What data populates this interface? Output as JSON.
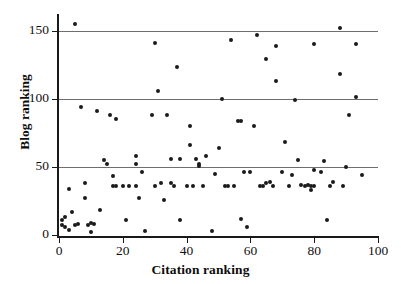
{
  "chart_data": {
    "type": "scatter",
    "title": "",
    "xlabel": "Citation ranking",
    "ylabel": "Blog ranking",
    "xlim": [
      0,
      100
    ],
    "ylim": [
      0,
      160
    ],
    "xticks": [
      0,
      20,
      40,
      60,
      80,
      100
    ],
    "yticks": [
      0,
      50,
      100,
      150
    ],
    "xtick_labels": [
      "0",
      "20",
      "40",
      "60",
      "80",
      "100"
    ],
    "ytick_labels": [
      "0",
      "50",
      "100",
      "150"
    ],
    "gridlines": {
      "horizontal_at": [
        50,
        100,
        150
      ],
      "color": "#6e6e6e",
      "vertical": false
    },
    "marker": {
      "shape": "circle",
      "color": "#1b1b1b",
      "size_px": 4
    },
    "legend": null,
    "n_points": 126,
    "points": [
      [
        5,
        155
      ],
      [
        1,
        7
      ],
      [
        1,
        11
      ],
      [
        2,
        13
      ],
      [
        2,
        6
      ],
      [
        3,
        4
      ],
      [
        3,
        34
      ],
      [
        4,
        17
      ],
      [
        5,
        7
      ],
      [
        6,
        8
      ],
      [
        7,
        94
      ],
      [
        8,
        38
      ],
      [
        8,
        27
      ],
      [
        9,
        7
      ],
      [
        10,
        2
      ],
      [
        10,
        9
      ],
      [
        11,
        8
      ],
      [
        12,
        91
      ],
      [
        13,
        18
      ],
      [
        14,
        55
      ],
      [
        15,
        52
      ],
      [
        16,
        88
      ],
      [
        17,
        43
      ],
      [
        17,
        36
      ],
      [
        18,
        85
      ],
      [
        18,
        36
      ],
      [
        20,
        36
      ],
      [
        21,
        11
      ],
      [
        22,
        36
      ],
      [
        24,
        58
      ],
      [
        24,
        52
      ],
      [
        24,
        36
      ],
      [
        25,
        27
      ],
      [
        26,
        46
      ],
      [
        27,
        3
      ],
      [
        29,
        88
      ],
      [
        30,
        141
      ],
      [
        30,
        36
      ],
      [
        31,
        106
      ],
      [
        32,
        38
      ],
      [
        33,
        26
      ],
      [
        34,
        88
      ],
      [
        35,
        38
      ],
      [
        35,
        56
      ],
      [
        36,
        36
      ],
      [
        37,
        123
      ],
      [
        38,
        56
      ],
      [
        38,
        11
      ],
      [
        40,
        36
      ],
      [
        41,
        66
      ],
      [
        41,
        80
      ],
      [
        42,
        36
      ],
      [
        43,
        56
      ],
      [
        44,
        52
      ],
      [
        44,
        51
      ],
      [
        45,
        36
      ],
      [
        46,
        58
      ],
      [
        48,
        3
      ],
      [
        49,
        45
      ],
      [
        50,
        64
      ],
      [
        51,
        100
      ],
      [
        52,
        36
      ],
      [
        53,
        36
      ],
      [
        54,
        143
      ],
      [
        55,
        36
      ],
      [
        56,
        84
      ],
      [
        57,
        84
      ],
      [
        57,
        12
      ],
      [
        58,
        46
      ],
      [
        59,
        6
      ],
      [
        60,
        46
      ],
      [
        61,
        80
      ],
      [
        62,
        147
      ],
      [
        63,
        36
      ],
      [
        64,
        36
      ],
      [
        65,
        129
      ],
      [
        65,
        38
      ],
      [
        66,
        39
      ],
      [
        67,
        36
      ],
      [
        68,
        113
      ],
      [
        68,
        139
      ],
      [
        70,
        46
      ],
      [
        71,
        68
      ],
      [
        72,
        36
      ],
      [
        73,
        44
      ],
      [
        74,
        99
      ],
      [
        75,
        55
      ],
      [
        76,
        37
      ],
      [
        77,
        36
      ],
      [
        78,
        37
      ],
      [
        79,
        36
      ],
      [
        79,
        33
      ],
      [
        80,
        140
      ],
      [
        80,
        48
      ],
      [
        80,
        36
      ],
      [
        82,
        46
      ],
      [
        83,
        54
      ],
      [
        84,
        11
      ],
      [
        85,
        36
      ],
      [
        86,
        39
      ],
      [
        88,
        152
      ],
      [
        88,
        118
      ],
      [
        89,
        36
      ],
      [
        90,
        50
      ],
      [
        91,
        88
      ],
      [
        93,
        140
      ],
      [
        93,
        101
      ],
      [
        95,
        44
      ]
    ]
  }
}
